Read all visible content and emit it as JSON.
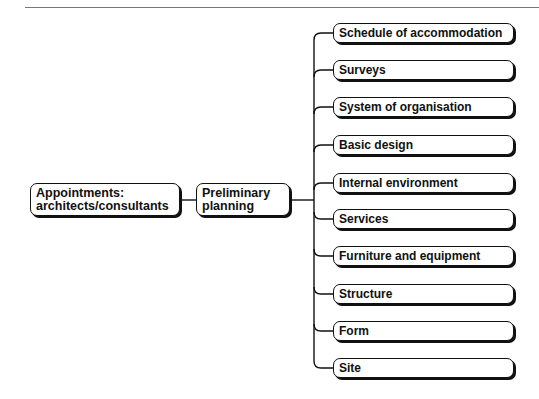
{
  "diagram": {
    "root": {
      "line1": "Appointments:",
      "line2": "architects/consultants"
    },
    "stage": {
      "line1": "Preliminary",
      "line2": "planning"
    },
    "branches": [
      {
        "label": "Schedule of accommodation"
      },
      {
        "label": "Surveys"
      },
      {
        "label": "System of organisation"
      },
      {
        "label": "Basic design"
      },
      {
        "label": "Internal environment"
      },
      {
        "label": "Services"
      },
      {
        "label": "Furniture and equipment"
      },
      {
        "label": "Structure"
      },
      {
        "label": "Form"
      },
      {
        "label": "Site"
      }
    ]
  }
}
